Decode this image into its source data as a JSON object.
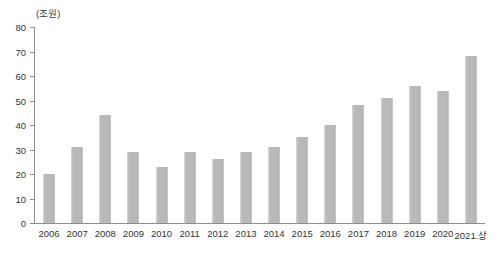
{
  "chart": {
    "unit_caption": "(조원)",
    "bar_color": "#b9b9b9",
    "axis_color": "#8d8d8d",
    "text_color": "#333333"
  },
  "chart_data": {
    "type": "bar",
    "title": "",
    "subtitle": "",
    "xlabel": "",
    "ylabel": "(조원)",
    "ylim": [
      0,
      80
    ],
    "yticks": [
      0,
      10,
      20,
      30,
      40,
      50,
      60,
      70,
      80
    ],
    "ytick_labels": [
      "0",
      "10",
      "20",
      "30",
      "40",
      "50",
      "60",
      "70",
      "80"
    ],
    "grid": false,
    "legend": false,
    "categories": [
      "2006",
      "2007",
      "2008",
      "2009",
      "2010",
      "2011",
      "2012",
      "2013",
      "2014",
      "2015",
      "2016",
      "2017",
      "2018",
      "2019",
      "2020",
      "2021.상"
    ],
    "values": [
      20,
      31,
      44,
      29,
      23,
      29,
      26,
      29,
      31,
      35,
      40,
      48,
      51,
      56,
      54,
      68
    ]
  }
}
